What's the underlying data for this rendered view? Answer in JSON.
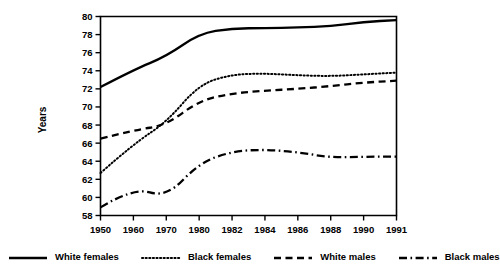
{
  "chart_data": {
    "type": "line",
    "title": "",
    "xlabel": "",
    "ylabel": "Years",
    "x": [
      "1950",
      "1960",
      "1970",
      "1980",
      "1982",
      "1984",
      "1986",
      "1988",
      "1990",
      "1991"
    ],
    "xtick_labels": [
      "1950",
      "1960",
      "1970",
      "1980",
      "1982",
      "1984",
      "1986",
      "1988",
      "1990",
      "1991"
    ],
    "ytick_labels": [
      "58",
      "60",
      "62",
      "64",
      "66",
      "68",
      "70",
      "72",
      "74",
      "76",
      "78",
      "80"
    ],
    "ylim": [
      58,
      80
    ],
    "ytick_step": 2,
    "grid": false,
    "legend_position": "bottom",
    "series": [
      {
        "name": "White females",
        "style": "solid",
        "values": [
          72.2,
          74.1,
          75.6,
          78.1,
          78.7,
          78.7,
          78.8,
          78.9,
          79.4,
          79.6
        ]
      },
      {
        "name": "Black females",
        "style": "dotted",
        "values": [
          62.7,
          65.9,
          68.3,
          72.5,
          73.6,
          73.7,
          73.5,
          73.4,
          73.6,
          73.8
        ]
      },
      {
        "name": "White males",
        "style": "dashed",
        "values": [
          66.5,
          67.4,
          68.0,
          70.7,
          71.5,
          71.8,
          72.0,
          72.3,
          72.7,
          72.9
        ]
      },
      {
        "name": "Black males",
        "style": "dashdot",
        "values": [
          58.9,
          61.1,
          60.0,
          63.8,
          65.1,
          65.3,
          65.0,
          64.4,
          64.5,
          64.5
        ]
      }
    ]
  },
  "legend": {
    "items": [
      {
        "label": "White females",
        "style": "solid"
      },
      {
        "label": "Black females",
        "style": "dotted"
      },
      {
        "label": "White males",
        "style": "dashed"
      },
      {
        "label": "Black males",
        "style": "dashdot"
      }
    ]
  }
}
